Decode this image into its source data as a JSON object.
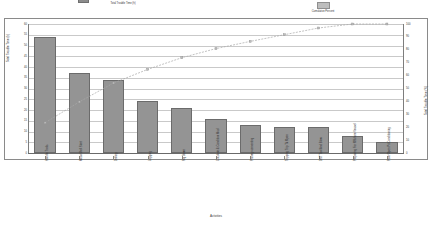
{
  "chart_data": {
    "type": "bar",
    "title": "",
    "xlabel": "Activities",
    "ylabel": "Total Trouble Time (h)",
    "ylabel_right": "Total Trouble Time (%)",
    "ylim": [
      0,
      60
    ],
    "ylim_right": [
      0,
      100
    ],
    "grid": true,
    "legend_position": "top",
    "categories": [
      "Handle Trails",
      "Meso Well Start",
      "Drilling",
      "Logging",
      "Rig Down",
      "Circulate & Condition Mud",
      "Primary cementing",
      "Tripping Trip Tk Open",
      "DST Tool And Blow",
      "Preparing For Offshore Vessel",
      "Pore Open Pit Conditioning"
    ],
    "values": [
      54,
      37,
      34,
      24,
      21,
      16,
      13,
      12,
      12,
      8,
      5
    ],
    "cumulative_label": "Cumulative Percent",
    "cumulative": [
      23.5,
      39.6,
      54.3,
      64.8,
      73.9,
      80.9,
      86.5,
      91.7,
      96.9,
      100.0,
      100.0
    ],
    "y_ticks": [
      "60",
      "55",
      "50",
      "45",
      "40",
      "35",
      "30",
      "25",
      "20",
      "15",
      "10",
      "5",
      "0"
    ],
    "y_ticks_right": [
      "100",
      "90",
      "80",
      "70",
      "60",
      "50",
      "40",
      "30",
      "20",
      "10",
      "0"
    ],
    "series": [
      {
        "name": "Total Trouble Time (h)",
        "type": "bar",
        "values": [
          54,
          37,
          34,
          24,
          21,
          16,
          13,
          12,
          12,
          8,
          5
        ]
      },
      {
        "name": "Cumulative Percent",
        "type": "line",
        "values": [
          23.5,
          39.6,
          54.3,
          64.8,
          73.9,
          80.9,
          86.5,
          91.7,
          96.9,
          100.0,
          100.0
        ]
      }
    ]
  },
  "legend": {
    "bar_label": "Total Trouble Time (h)",
    "line_label": "Cumulative Percent"
  },
  "colors": {
    "bar_fill": "#949494",
    "bar_stroke": "#6b6b6b",
    "line": "#a8a8a8",
    "grid": "#c9c9c9",
    "axis": "#7d7d7d"
  }
}
